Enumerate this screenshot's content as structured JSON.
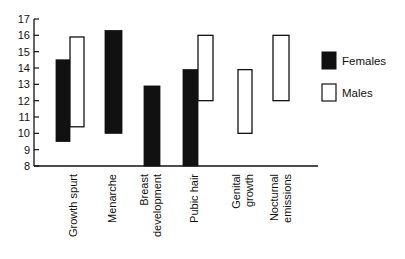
{
  "chart_data": {
    "type": "bar",
    "subtype": "floating-range",
    "title": "",
    "xlabel": "",
    "ylabel": "",
    "ylim": [
      8,
      17
    ],
    "yticks": [
      8,
      9,
      10,
      11,
      12,
      13,
      14,
      15,
      16,
      17
    ],
    "grid": false,
    "legend_position": "right",
    "categories": [
      {
        "label": [
          "Growth spurt"
        ]
      },
      {
        "label": [
          "Menarche"
        ]
      },
      {
        "label": [
          "Breast",
          "development"
        ]
      },
      {
        "label": [
          "Pubic hair"
        ]
      },
      {
        "label": [
          "Genital",
          "growth"
        ]
      },
      {
        "label": [
          "Nocturnal",
          "emissions"
        ]
      }
    ],
    "series": [
      {
        "name": "Females",
        "color": "#111111",
        "fill": "solid",
        "ranges": [
          [
            9.5,
            14.5
          ],
          [
            10.0,
            16.3
          ],
          [
            8.0,
            12.9
          ],
          [
            8.0,
            13.9
          ],
          null,
          null
        ]
      },
      {
        "name": "Males",
        "color": "#ffffff",
        "fill": "outline",
        "ranges": [
          [
            10.4,
            15.9
          ],
          null,
          null,
          [
            12.0,
            16.0
          ],
          [
            10.0,
            13.9
          ],
          [
            12.0,
            16.0
          ]
        ]
      }
    ]
  },
  "legend": {
    "females": "Females",
    "males": "Males"
  }
}
